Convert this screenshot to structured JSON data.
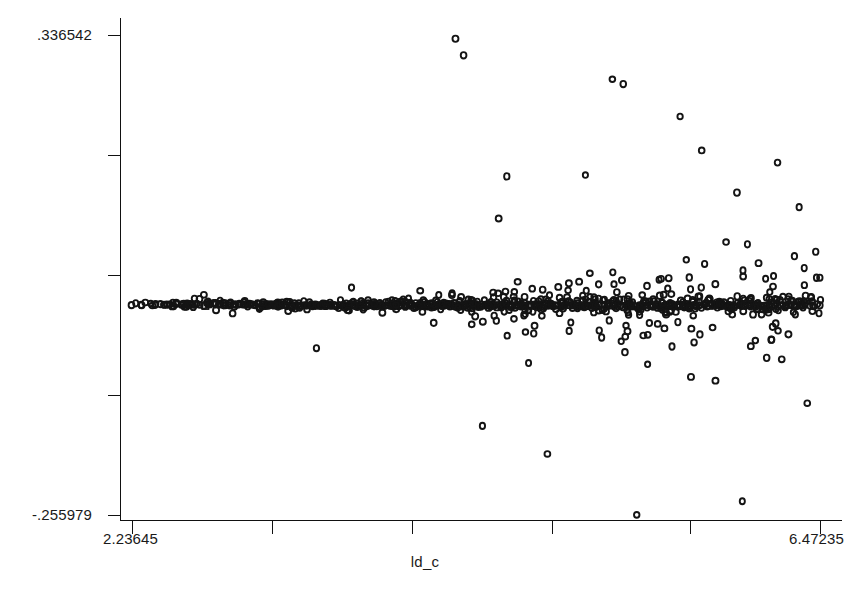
{
  "chart_data": {
    "type": "scatter",
    "title": "",
    "subtitle": "",
    "xlabel": "ld_c",
    "ylabel": "",
    "xlim": [
      2.23645,
      6.47235
    ],
    "ylim": [
      -0.255979,
      0.336542
    ],
    "grid": false,
    "legend": null,
    "x_tick_labels": [
      "2.23645",
      "6.47235"
    ],
    "y_tick_labels": [
      ".336542",
      "-.255979"
    ],
    "x_tick_values": [
      2.23645,
      3.1,
      3.96,
      4.82,
      5.67,
      6.47235
    ],
    "y_tick_values": [
      0.336542,
      0.188,
      0.04,
      -0.108,
      -0.255979
    ],
    "marker_style": "open-circle",
    "marker_secondary_style": "open-square",
    "marker_color": "#141414",
    "axis_color": "#111111",
    "background_color": "#ffffff",
    "n_points": 268,
    "points": [
      [
        2.296,
        0.003
      ],
      [
        2.378,
        0.0034
      ],
      [
        2.469,
        0.004
      ],
      [
        2.493,
        0.0018
      ],
      [
        2.508,
        0.0046
      ],
      [
        2.56,
        0.0007
      ],
      [
        2.576,
        0.0052
      ],
      [
        2.621,
        0.0113
      ],
      [
        2.636,
        0.0048
      ],
      [
        2.652,
        0.0106
      ],
      [
        2.679,
        0.0158
      ],
      [
        2.688,
        0.0021
      ],
      [
        2.712,
        0.0041
      ],
      [
        2.739,
        0.0056
      ],
      [
        2.754,
        -0.0032
      ],
      [
        2.776,
        0.0037
      ],
      [
        2.796,
        0.006
      ],
      [
        2.812,
        0.0029
      ],
      [
        2.838,
        0.0051
      ],
      [
        2.856,
        -0.0071
      ],
      [
        2.871,
        0.0043
      ],
      [
        2.896,
        0.0047
      ],
      [
        2.918,
        0.004
      ],
      [
        2.935,
        0.0033
      ],
      [
        2.961,
        0.0046
      ],
      [
        2.984,
        0.0036
      ],
      [
        3.009,
        0.0057
      ],
      [
        3.021,
        -0.0015
      ],
      [
        3.044,
        0.0039
      ],
      [
        3.068,
        0.003
      ],
      [
        3.093,
        0.0041
      ],
      [
        3.109,
        0.0024
      ],
      [
        3.132,
        0.0036
      ],
      [
        3.156,
        0.0029
      ],
      [
        3.182,
        0.0037
      ],
      [
        3.198,
        -0.0041
      ],
      [
        3.216,
        0.003
      ],
      [
        3.241,
        -0.0013
      ],
      [
        3.258,
        0.0033
      ],
      [
        3.274,
        0.0025
      ],
      [
        3.298,
        0.0031
      ],
      [
        3.314,
        -0.0022
      ],
      [
        3.339,
        0.0028
      ],
      [
        3.356,
        0.0036
      ],
      [
        3.372,
        -0.0501
      ],
      [
        3.388,
        0.0022
      ],
      [
        3.403,
        0.0034
      ],
      [
        3.427,
        0.0018
      ],
      [
        3.441,
        0.0031
      ],
      [
        3.462,
        0.0027
      ],
      [
        3.481,
        0.0035
      ],
      [
        3.497,
        0.0021
      ],
      [
        3.513,
        0.0029
      ],
      [
        3.538,
        0.0033
      ],
      [
        3.556,
        0.0009
      ],
      [
        3.572,
        0.0027
      ],
      [
        3.588,
        0.0247
      ],
      [
        3.604,
        0.0031
      ],
      [
        3.629,
        0.0022
      ],
      [
        3.644,
        0.0028
      ],
      [
        3.661,
        0.0035
      ],
      [
        3.678,
        0.0019
      ],
      [
        3.694,
        0.003
      ],
      [
        3.711,
        0.0026
      ],
      [
        3.728,
        0.0032
      ],
      [
        3.744,
        0.0017
      ],
      [
        3.761,
        0.0028
      ],
      [
        3.778,
        -0.0062
      ],
      [
        3.794,
        0.0024
      ],
      [
        3.811,
        0.003
      ],
      [
        3.828,
        0.0021
      ],
      [
        3.844,
        0.0027
      ],
      [
        3.861,
        0.0033
      ],
      [
        3.878,
        0.0018
      ],
      [
        3.894,
        0.0026
      ],
      [
        3.911,
        0.0031
      ],
      [
        3.928,
        0.0022
      ],
      [
        3.944,
        0.0029
      ],
      [
        3.961,
        0.0034
      ],
      [
        3.978,
        0.0016
      ],
      [
        3.994,
        0.0025
      ],
      [
        4.011,
        0.0208
      ],
      [
        4.028,
        0.003
      ],
      [
        4.044,
        0.0021
      ],
      [
        4.061,
        0.0027
      ],
      [
        4.078,
        0.0033
      ],
      [
        4.094,
        -0.0188
      ],
      [
        4.111,
        0.0024
      ],
      [
        4.128,
        0.003
      ],
      [
        4.144,
        0.0019
      ],
      [
        4.161,
        0.0026
      ],
      [
        4.178,
        0.0032
      ],
      [
        4.194,
        0.0015
      ],
      [
        4.211,
        0.0028
      ],
      [
        4.228,
        0.3319
      ],
      [
        4.244,
        0.0022
      ],
      [
        4.261,
        0.0029
      ],
      [
        4.278,
        0.3115
      ],
      [
        4.294,
        0.0034
      ],
      [
        4.311,
        0.0017
      ],
      [
        4.328,
        -0.0051
      ],
      [
        4.344,
        0.0025
      ],
      [
        4.361,
        0.0031
      ],
      [
        4.378,
        0.002
      ],
      [
        4.394,
        -0.146
      ],
      [
        4.411,
        0.0027
      ],
      [
        4.428,
        0.0033
      ],
      [
        4.444,
        0.0014
      ],
      [
        4.461,
        0.0026
      ],
      [
        4.478,
        0.0032
      ],
      [
        4.494,
        0.11
      ],
      [
        4.511,
        0.0018
      ],
      [
        4.528,
        0.0029
      ],
      [
        4.544,
        0.162
      ],
      [
        4.561,
        0.0035
      ],
      [
        4.578,
        0.0021
      ],
      [
        4.594,
        0.0027
      ],
      [
        4.611,
        0.0318
      ],
      [
        4.628,
        0.0016
      ],
      [
        4.644,
        0.0024
      ],
      [
        4.661,
        0.003
      ],
      [
        4.678,
        -0.0684
      ],
      [
        4.694,
        0.0036
      ],
      [
        4.711,
        0.0019
      ],
      [
        4.728,
        0.0026
      ],
      [
        4.744,
        0.0032
      ],
      [
        4.761,
        0.0013
      ],
      [
        4.778,
        0.0028
      ],
      [
        4.794,
        -0.1806
      ],
      [
        4.811,
        0.0034
      ],
      [
        4.828,
        0.002
      ],
      [
        4.844,
        0.0027
      ],
      [
        4.861,
        0.0255
      ],
      [
        4.878,
        0.0015
      ],
      [
        4.894,
        0.0023
      ],
      [
        4.911,
        0.0031
      ],
      [
        4.928,
        -0.0287
      ],
      [
        4.944,
        0.0025
      ],
      [
        4.961,
        0.0033
      ],
      [
        4.978,
        0.0017
      ],
      [
        4.994,
        0.0024
      ],
      [
        5.011,
        0.003
      ],
      [
        5.028,
        0.1636
      ],
      [
        5.044,
        0.0021
      ],
      [
        5.061,
        0.0028
      ],
      [
        5.078,
        0.0035
      ],
      [
        5.094,
        0.0012
      ],
      [
        5.111,
        0.0026
      ],
      [
        5.128,
        -0.0369
      ],
      [
        5.144,
        0.0032
      ],
      [
        5.161,
        0.0018
      ],
      [
        5.178,
        0.0025
      ],
      [
        5.194,
        0.282
      ],
      [
        5.211,
        0.0031
      ],
      [
        5.228,
        0.0014
      ],
      [
        5.244,
        0.0023
      ],
      [
        5.261,
        0.276
      ],
      [
        5.278,
        0.0029
      ],
      [
        5.294,
        0.0036
      ],
      [
        5.311,
        0.0016
      ],
      [
        5.328,
        0.0024
      ],
      [
        5.344,
        -0.2558
      ],
      [
        5.361,
        0.0031
      ],
      [
        5.378,
        0.0019
      ],
      [
        5.394,
        0.0027
      ],
      [
        5.411,
        -0.07
      ],
      [
        5.428,
        0.0034
      ],
      [
        5.444,
        0.0013
      ],
      [
        5.461,
        0.0022
      ],
      [
        5.478,
        0.0029
      ],
      [
        5.494,
        0.0356
      ],
      [
        5.511,
        0.0017
      ],
      [
        5.528,
        0.0025
      ],
      [
        5.544,
        0.0032
      ],
      [
        5.561,
        -0.048
      ],
      [
        5.578,
        0.0021
      ],
      [
        5.594,
        0.0028
      ],
      [
        5.611,
        0.236
      ],
      [
        5.628,
        0.0035
      ],
      [
        5.644,
        0.0015
      ],
      [
        5.661,
        0.0023
      ],
      [
        5.678,
        -0.0855
      ],
      [
        5.694,
        0.003
      ],
      [
        5.711,
        0.0018
      ],
      [
        5.728,
        0.0026
      ],
      [
        5.744,
        0.194
      ],
      [
        5.761,
        0.0033
      ],
      [
        5.778,
        0.0014
      ],
      [
        5.794,
        0.0022
      ],
      [
        5.811,
        -0.0246
      ],
      [
        5.828,
        0.0029
      ],
      [
        5.844,
        0.0036
      ],
      [
        5.861,
        0.0017
      ],
      [
        5.878,
        0.0025
      ],
      [
        5.894,
        0.081
      ],
      [
        5.911,
        0.0032
      ],
      [
        5.928,
        0.0019
      ],
      [
        5.944,
        0.0027
      ],
      [
        5.961,
        0.142
      ],
      [
        5.978,
        0.0034
      ],
      [
        5.994,
        -0.239
      ],
      [
        6.011,
        0.0021
      ],
      [
        6.028,
        0.0028
      ],
      [
        6.044,
        0.0016
      ],
      [
        6.061,
        0.0024
      ],
      [
        6.078,
        0.0031
      ],
      [
        6.094,
        0.0549
      ],
      [
        6.111,
        0.0018
      ],
      [
        6.128,
        0.0026
      ],
      [
        6.144,
        -0.062
      ],
      [
        6.161,
        0.0033
      ],
      [
        6.178,
        0.0015
      ],
      [
        6.194,
        0.0023
      ],
      [
        6.211,
        0.179
      ],
      [
        6.228,
        0.003
      ],
      [
        6.244,
        0.0037
      ],
      [
        6.261,
        0.002
      ],
      [
        6.278,
        -0.033
      ],
      [
        6.294,
        0.0027
      ],
      [
        6.311,
        0.0034
      ],
      [
        6.328,
        0.0017
      ],
      [
        6.344,
        0.124
      ],
      [
        6.361,
        0.0025
      ],
      [
        6.378,
        0.0032
      ],
      [
        6.394,
        -0.118
      ],
      [
        6.411,
        0.0019
      ],
      [
        6.428,
        0.0026
      ],
      [
        6.446,
        0.069
      ]
    ]
  }
}
